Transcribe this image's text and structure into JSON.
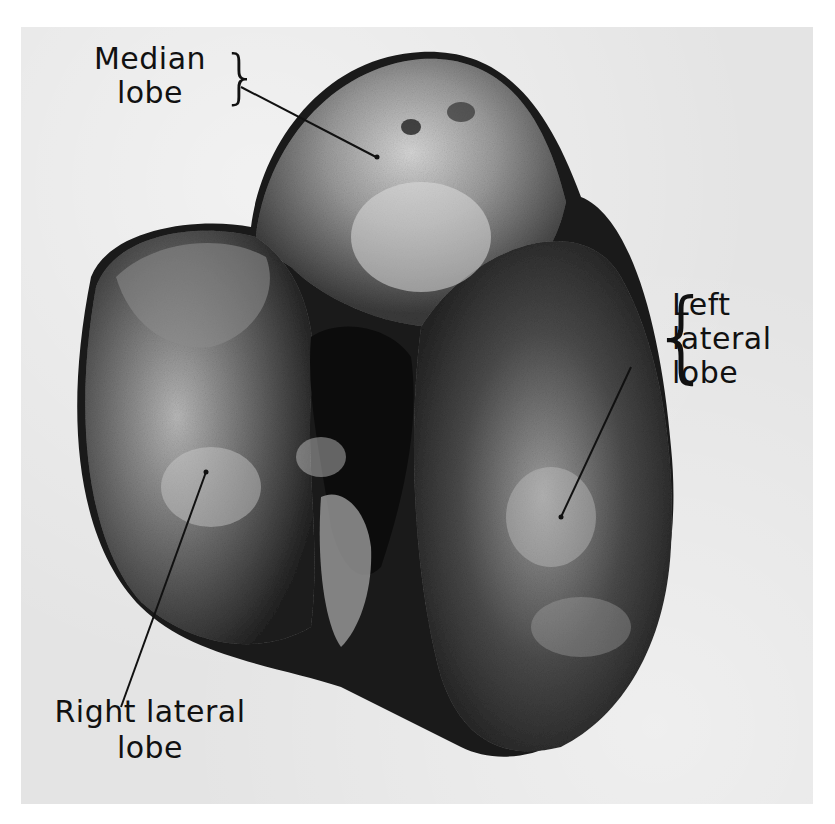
{
  "figure": {
    "labels": [
      {
        "id": "median",
        "lines": [
          "Median",
          "lobe"
        ]
      },
      {
        "id": "left-lateral",
        "lines": [
          "Left",
          "lateral",
          "lobe"
        ]
      },
      {
        "id": "right-lateral",
        "lines": [
          "Right lateral",
          "lobe"
        ]
      }
    ],
    "colors": {
      "background": "#e4e4e4",
      "specimen_dark": "#141414",
      "specimen_mid": "#5a5a5a",
      "specimen_light": "#c8c8c8",
      "ink": "#111111"
    }
  }
}
